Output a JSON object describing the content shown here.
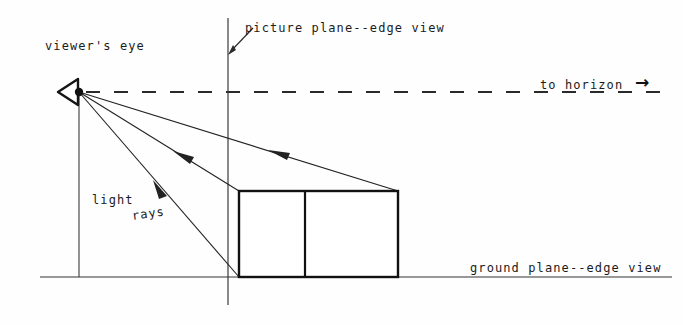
{
  "diagram": {
    "background_color": "#fefefe",
    "ink_color": "#1b1b1b",
    "labels": {
      "viewers_eye": "viewer's eye",
      "picture_plane": "picture plane--edge view",
      "to_horizon": "to horizon",
      "ground_plane": "ground plane--edge view",
      "light": "light",
      "rays": "rays"
    },
    "icons": {
      "horizon_arrow": "→"
    },
    "geometry": {
      "eye_point": {
        "x": 79,
        "y": 92
      },
      "eye_symbol": {
        "apex_x": 79,
        "apex_y": 92,
        "back_x": 58,
        "top_y": 79,
        "bottom_y": 105
      },
      "horizon_line": {
        "y": 92,
        "x_start": 86,
        "x_end": 670,
        "dash": 14,
        "gap": 14
      },
      "picture_plane_line": {
        "x": 228,
        "y_top": 18,
        "y_bottom": 305
      },
      "ground_line": {
        "y": 277,
        "x_start": 40,
        "x_end": 672
      },
      "eye_vertical_drop": {
        "x": 79,
        "y_top": 92,
        "y_bottom": 277
      },
      "box": {
        "left": 239,
        "right": 398,
        "top": 191,
        "bottom": 277,
        "divider_x": 305
      },
      "light_rays": [
        {
          "name": "ray-to-box-top-right",
          "x1": 79,
          "y1": 92,
          "x2": 398,
          "y2": 191,
          "arrow_t": 0.62
        },
        {
          "name": "ray-to-box-top-left",
          "x1": 79,
          "y1": 92,
          "x2": 239,
          "y2": 191,
          "arrow_t": 0.6
        },
        {
          "name": "ray-to-box-bottom-left",
          "x1": 79,
          "y1": 92,
          "x2": 239,
          "y2": 277,
          "arrow_t": 0.47
        }
      ],
      "picture_plane_pointer": {
        "x1": 253,
        "y1": 28,
        "x2": 229,
        "y2": 53
      }
    }
  }
}
